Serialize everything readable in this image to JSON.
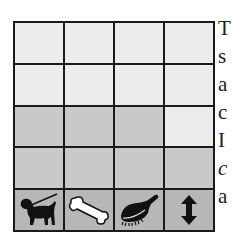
{
  "grid": {
    "rows": 5,
    "cols": 4,
    "cells": [
      [
        "light",
        "light",
        "light",
        "light"
      ],
      [
        "light",
        "light",
        "light",
        "light"
      ],
      [
        "gray",
        "gray",
        "gray",
        "light"
      ],
      [
        "gray",
        "gray",
        "gray",
        "gray"
      ],
      [
        "dark",
        "dark",
        "dark",
        "dark"
      ]
    ],
    "icon_row": [
      {
        "icon": "dog-on-leash-icon"
      },
      {
        "icon": "bone-icon"
      },
      {
        "icon": "brush-icon"
      },
      {
        "icon": "up-down-arrow-icon"
      }
    ]
  },
  "side_text": {
    "lines": [
      "T",
      "s",
      "a",
      "c",
      "I",
      "c",
      "a"
    ]
  },
  "colors": {
    "light": "#ececec",
    "gray": "#c9c9c9",
    "dark": "#b7b7b7",
    "border": "#1a1a1a"
  }
}
